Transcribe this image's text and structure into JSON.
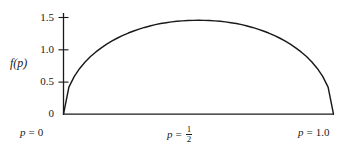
{
  "chart_data": {
    "type": "line",
    "title": "",
    "subtitle": "",
    "xlabel": "",
    "ylabel": "f(p)",
    "xlim": [
      0,
      1.0
    ],
    "ylim": [
      0,
      1.6
    ],
    "grid": false,
    "legend": "none",
    "x_tick_labels": [
      "p = 0",
      "p = ½",
      "p = 1.0"
    ],
    "x_tick_values": [
      0,
      0.5,
      1.0
    ],
    "y_tick_labels": [
      "0",
      "0.5",
      "1.0",
      "1.5"
    ],
    "y_tick_values": [
      0,
      0.5,
      1.0,
      1.5
    ],
    "series": [
      {
        "name": "f(p)",
        "color": "#1a1a1a",
        "x": [
          0.0,
          0.02,
          0.04,
          0.06,
          0.08,
          0.1,
          0.12,
          0.14,
          0.16,
          0.18,
          0.2,
          0.22,
          0.24,
          0.26,
          0.28,
          0.3,
          0.32,
          0.34,
          0.36,
          0.38,
          0.4,
          0.42,
          0.44,
          0.46,
          0.48,
          0.5,
          0.52,
          0.54,
          0.56,
          0.58,
          0.6,
          0.62,
          0.64,
          0.66,
          0.68,
          0.7,
          0.72,
          0.74,
          0.76,
          0.78,
          0.8,
          0.82,
          0.84,
          0.86,
          0.88,
          0.9,
          0.92,
          0.94,
          0.96,
          0.98,
          1.0
        ],
        "y": [
          0.0,
          0.42,
          0.587,
          0.71,
          0.81,
          0.894,
          0.966,
          1.03,
          1.086,
          1.136,
          1.182,
          1.222,
          1.259,
          1.291,
          1.32,
          1.346,
          1.369,
          1.389,
          1.406,
          1.42,
          1.432,
          1.441,
          1.448,
          1.453,
          1.455,
          1.456,
          1.455,
          1.453,
          1.448,
          1.441,
          1.432,
          1.42,
          1.406,
          1.389,
          1.369,
          1.346,
          1.32,
          1.291,
          1.259,
          1.222,
          1.182,
          1.136,
          1.086,
          1.03,
          0.966,
          0.894,
          0.81,
          0.71,
          0.587,
          0.42,
          0.0
        ]
      }
    ],
    "peak": {
      "x": 0.5,
      "y": 1.5
    },
    "annotations": []
  },
  "axes": {
    "y_label": "f(p)",
    "y_ticks": [
      {
        "label": "1.5",
        "value": 1.5
      },
      {
        "label": "1.0",
        "value": 1.0
      },
      {
        "label": "0.5",
        "value": 0.5
      },
      {
        "label": "0",
        "value": 0
      }
    ],
    "x_ticks": [
      {
        "prefix": "p",
        "eq": "=",
        "value": "0",
        "kind": "plain"
      },
      {
        "prefix": "p",
        "eq": "=",
        "numerator": "1",
        "denominator": "2",
        "kind": "fraction"
      },
      {
        "prefix": "p",
        "eq": "=",
        "value": "1.0",
        "kind": "plain"
      }
    ]
  },
  "style": {
    "curve_color": "#1a1a1a",
    "axis_color": "#1a1a1a",
    "background": "#ffffff"
  }
}
